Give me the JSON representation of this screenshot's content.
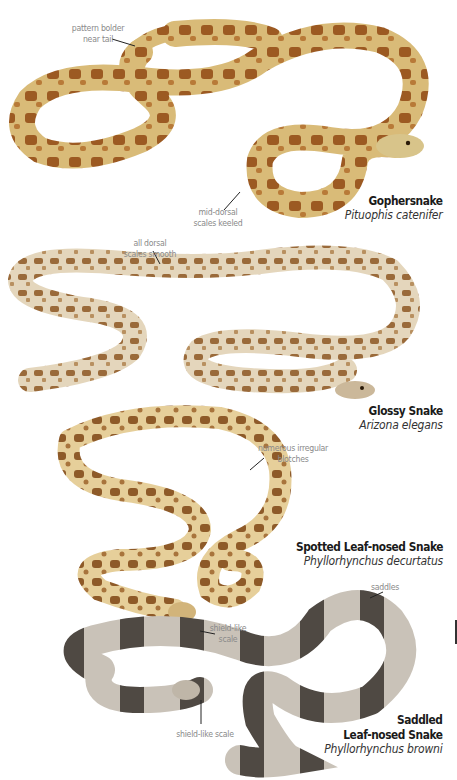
{
  "species": [
    {
      "common_name": "Gophersnake",
      "scientific_name": "Pituophis catenifer",
      "annotations": [
        {
          "text_line1": "pattern bolder",
          "text_line2": "near tail"
        },
        {
          "text_line1": "mid-dorsal",
          "text_line2": "scales keeled"
        }
      ],
      "colors": {
        "base": "#d9bb78",
        "blotch": "#9c5a22",
        "dark": "#6b3a14"
      }
    },
    {
      "common_name": "Glossy Snake",
      "scientific_name": "Arizona elegans",
      "annotations": [
        {
          "text_line1": "all dorsal",
          "text_line2": "scales smooth"
        }
      ],
      "colors": {
        "base": "#e4d6bc",
        "blotch": "#9a6a3a",
        "dark": "#6d4a2a"
      }
    },
    {
      "common_name": "Spotted Leaf-nosed Snake",
      "scientific_name": "Phyllorhynchus decurtatus",
      "annotations": [
        {
          "text_line1": "numerous irregular",
          "text_line2": "blotches"
        },
        {
          "text_line1": "shield-like",
          "text_line2": "scale"
        }
      ],
      "colors": {
        "base": "#e6cf9a",
        "blotch": "#8e5a28",
        "dark": "#5e3818"
      }
    },
    {
      "common_name_line1": "Saddled",
      "common_name_line2": "Leaf-nosed Snake",
      "scientific_name": "Phyllorhynchus browni",
      "annotations": [
        {
          "text": "saddles"
        },
        {
          "text": "shield-like scale"
        }
      ],
      "colors": {
        "base": "#c9c2b8",
        "blotch": "#4f4943",
        "dark": "#3a3531"
      }
    }
  ]
}
